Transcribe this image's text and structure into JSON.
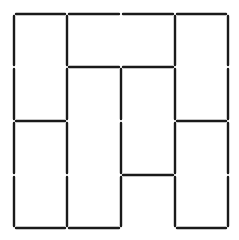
{
  "diagram": {
    "type": "matchstick-grid",
    "grid_size": 4,
    "grid_x": [
      14,
      67,
      121,
      175,
      228
    ],
    "grid_y": [
      14,
      67,
      121,
      175,
      228
    ],
    "stroke_color": "#1a1a1a",
    "background": "#ffffff",
    "horizontal_segments": [
      {
        "row": 0,
        "col": 0
      },
      {
        "row": 0,
        "col": 1
      },
      {
        "row": 0,
        "col": 2
      },
      {
        "row": 0,
        "col": 3
      },
      {
        "row": 1,
        "col": 1
      },
      {
        "row": 1,
        "col": 2
      },
      {
        "row": 2,
        "col": 0
      },
      {
        "row": 2,
        "col": 3
      },
      {
        "row": 3,
        "col": 2
      },
      {
        "row": 4,
        "col": 0
      },
      {
        "row": 4,
        "col": 1
      },
      {
        "row": 4,
        "col": 3
      }
    ],
    "vertical_segments": [
      {
        "col": 0,
        "row": 0
      },
      {
        "col": 0,
        "row": 1
      },
      {
        "col": 0,
        "row": 2
      },
      {
        "col": 0,
        "row": 3
      },
      {
        "col": 1,
        "row": 0
      },
      {
        "col": 1,
        "row": 1
      },
      {
        "col": 1,
        "row": 2
      },
      {
        "col": 1,
        "row": 3
      },
      {
        "col": 2,
        "row": 1
      },
      {
        "col": 2,
        "row": 2
      },
      {
        "col": 2,
        "row": 3
      },
      {
        "col": 3,
        "row": 0
      },
      {
        "col": 3,
        "row": 1
      },
      {
        "col": 3,
        "row": 2
      },
      {
        "col": 3,
        "row": 3
      },
      {
        "col": 4,
        "row": 0
      },
      {
        "col": 4,
        "row": 1
      },
      {
        "col": 4,
        "row": 2
      },
      {
        "col": 4,
        "row": 3
      }
    ]
  }
}
